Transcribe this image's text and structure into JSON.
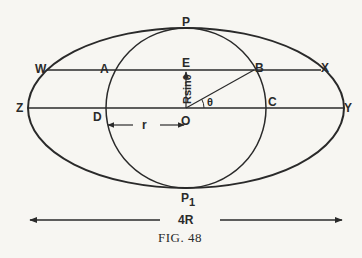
{
  "figure": {
    "caption": "FIG. 48",
    "colors": {
      "ink": "#2a2a2a",
      "paper": "#f7f6f2"
    },
    "points": {
      "P": "P",
      "P1": "P",
      "P1_sub": "1",
      "W": "W",
      "A": "A",
      "E": "E",
      "B": "B",
      "X": "X",
      "Z": "Z",
      "D": "D",
      "O": "O",
      "C": "C",
      "Y": "Y"
    },
    "labels": {
      "height": "Rsinθ",
      "angle": "θ",
      "radius": "r",
      "width": "4R"
    },
    "shapes": {
      "ellipse": {
        "cx": 186,
        "cy": 108,
        "rx": 158,
        "ry": 80
      },
      "circle": {
        "cx": 186,
        "cy": 108,
        "r": 80
      },
      "upper_chord_y": 70,
      "diameter_y": 108
    }
  }
}
